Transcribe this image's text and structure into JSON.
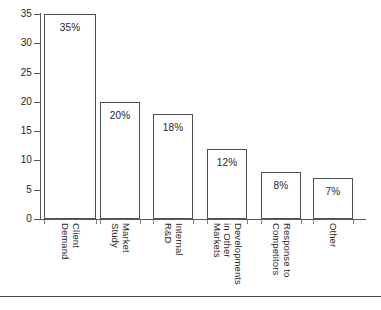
{
  "chart_data": {
    "type": "bar",
    "title": "",
    "subtitle": "",
    "xlabel": "",
    "ylabel": "",
    "categories": [
      "Client Demand",
      "Market Study",
      "Internal R&D",
      "Developments in Other Markets",
      "Response to Competitors",
      "Other"
    ],
    "category_lines": [
      [
        "Client",
        "Demand"
      ],
      [
        "Market",
        "Study"
      ],
      [
        "Internal",
        "R&D"
      ],
      [
        "Developments",
        "in Other",
        "Markets"
      ],
      [
        "Response to",
        "Competitors"
      ],
      [
        "Other"
      ]
    ],
    "values": [
      35,
      20,
      18,
      12,
      8,
      7
    ],
    "data_labels": [
      "35%",
      "20%",
      "18%",
      "12%",
      "8%",
      "7%"
    ],
    "ylim": [
      0,
      35
    ],
    "yticks": [
      0,
      5,
      10,
      15,
      20,
      25,
      30,
      35
    ],
    "ytick_labels": [
      "0",
      "5",
      "10",
      "15",
      "20",
      "25",
      "30",
      "35"
    ],
    "grid": false,
    "legend": false,
    "legend_position": "none",
    "bar_fill_color": "#ffffff",
    "bar_border_color": "#4c5155",
    "axis_color": "#555a5e",
    "text_color": "#1f1f1f"
  }
}
